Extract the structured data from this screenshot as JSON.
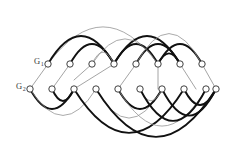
{
  "figure": {
    "background_color": "#ffffff",
    "width": 226,
    "height": 166,
    "labels": [
      {
        "id": "label-g1",
        "base": "G",
        "sub": "1",
        "x": 34,
        "y": 64
      },
      {
        "id": "label-g2",
        "base": "G",
        "sub": "2",
        "x": 16,
        "y": 89
      }
    ],
    "colors": {
      "arc_thick": "#111111",
      "arc_thin": "#8d8d8d",
      "node_fill": "#ffffff",
      "node_stroke": "#2a2a2a",
      "label": "#3a3a3a"
    },
    "node_radius": 3.2,
    "rows": {
      "top": {
        "name": "top-row",
        "y": 64,
        "count": 8,
        "x": [
          48,
          70,
          92,
          114,
          136,
          158,
          180,
          202
        ]
      },
      "bottom": {
        "name": "bottom-row",
        "y": 89,
        "count": 10,
        "x": [
          30,
          52,
          74,
          96,
          118,
          140,
          162,
          184,
          206,
          216
        ]
      }
    },
    "arcs_above": [
      {
        "name": "arc-top-1",
        "x1": 48,
        "x2": 158,
        "h": 56,
        "style": "thin"
      },
      {
        "name": "arc-top-2",
        "x1": 48,
        "x2": 114,
        "h": 42,
        "style": "thick"
      },
      {
        "name": "arc-top-3",
        "x1": 70,
        "x2": 114,
        "h": 30,
        "style": "thick"
      },
      {
        "name": "arc-top-4",
        "x1": 92,
        "x2": 114,
        "h": 18,
        "style": "thin"
      },
      {
        "name": "arc-top-5",
        "x1": 114,
        "x2": 180,
        "h": 42,
        "style": "thick"
      },
      {
        "name": "arc-top-6",
        "x1": 114,
        "x2": 158,
        "h": 30,
        "style": "thick"
      },
      {
        "name": "arc-top-7",
        "x1": 136,
        "x2": 180,
        "h": 30,
        "style": "thick"
      },
      {
        "name": "arc-top-8",
        "x1": 158,
        "x2": 202,
        "h": 30,
        "style": "thick"
      },
      {
        "name": "arc-top-9",
        "x1": 136,
        "x2": 202,
        "h": 46,
        "style": "thin"
      },
      {
        "name": "arc-top-10",
        "x1": 158,
        "x2": 180,
        "h": 16,
        "style": "thick"
      },
      {
        "name": "arc-top-11",
        "x1": 92,
        "x2": 158,
        "h": 38,
        "style": "thin"
      }
    ],
    "arcs_below": [
      {
        "name": "arc-bot-1",
        "x1": 30,
        "x2": 74,
        "h": 30,
        "style": "thick"
      },
      {
        "name": "arc-bot-2",
        "x1": 52,
        "x2": 74,
        "h": 18,
        "style": "thick"
      },
      {
        "name": "arc-bot-3",
        "x1": 30,
        "x2": 96,
        "h": 40,
        "style": "thin"
      },
      {
        "name": "arc-bot-4",
        "x1": 74,
        "x2": 184,
        "h": 66,
        "style": "thick"
      },
      {
        "name": "arc-bot-5",
        "x1": 96,
        "x2": 162,
        "h": 44,
        "style": "thin"
      },
      {
        "name": "arc-bot-6",
        "x1": 118,
        "x2": 162,
        "h": 30,
        "style": "thick"
      },
      {
        "name": "arc-bot-7",
        "x1": 140,
        "x2": 162,
        "h": 18,
        "style": "thin"
      },
      {
        "name": "arc-bot-8",
        "x1": 118,
        "x2": 206,
        "h": 56,
        "style": "thin"
      },
      {
        "name": "arc-bot-9",
        "x1": 140,
        "x2": 206,
        "h": 48,
        "style": "thick"
      },
      {
        "name": "arc-bot-10",
        "x1": 162,
        "x2": 216,
        "h": 40,
        "style": "thick"
      },
      {
        "name": "arc-bot-11",
        "x1": 96,
        "x2": 216,
        "h": 72,
        "style": "thick"
      },
      {
        "name": "arc-bot-12",
        "x1": 184,
        "x2": 216,
        "h": 24,
        "style": "thick"
      }
    ],
    "cross_edges": [
      {
        "name": "edge-cross-1",
        "x1": 48,
        "y1": 64,
        "x2": 30,
        "y2": 89
      },
      {
        "name": "edge-cross-2",
        "x1": 70,
        "y1": 64,
        "x2": 52,
        "y2": 89
      },
      {
        "name": "edge-cross-3",
        "x1": 114,
        "y1": 64,
        "x2": 74,
        "y2": 89
      },
      {
        "name": "edge-cross-4",
        "x1": 136,
        "y1": 64,
        "x2": 118,
        "y2": 89
      },
      {
        "name": "edge-cross-5",
        "x1": 158,
        "y1": 64,
        "x2": 158,
        "y2": 89
      },
      {
        "name": "edge-cross-6",
        "x1": 180,
        "y1": 64,
        "x2": 196,
        "y2": 89
      },
      {
        "name": "edge-cross-7",
        "x1": 202,
        "y1": 64,
        "x2": 216,
        "y2": 89
      },
      {
        "name": "edge-cross-8",
        "x1": 92,
        "y1": 64,
        "x2": 74,
        "y2": 80
      }
    ]
  }
}
